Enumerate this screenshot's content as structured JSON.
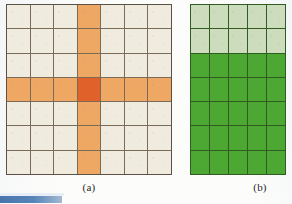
{
  "figure": {
    "panels": [
      {
        "id": "a",
        "caption": "(a)",
        "rows": 7,
        "cols": 7,
        "base_color": "#F0EBDF",
        "highlight_color": "#EFA864",
        "center_color": "#E0622A",
        "gridline_color": "#6B5D4C",
        "highlight_row": 4,
        "highlight_col": 4,
        "cells": [
          [
            "base",
            "base",
            "base",
            "arm",
            "base",
            "base",
            "base"
          ],
          [
            "base",
            "base",
            "base",
            "arm",
            "base",
            "base",
            "base"
          ],
          [
            "base",
            "base",
            "base",
            "arm",
            "base",
            "base",
            "base"
          ],
          [
            "arm",
            "arm",
            "arm",
            "center",
            "arm",
            "arm",
            "arm"
          ],
          [
            "base",
            "base",
            "base",
            "arm",
            "base",
            "base",
            "base"
          ],
          [
            "base",
            "base",
            "base",
            "arm",
            "base",
            "base",
            "base"
          ],
          [
            "base",
            "base",
            "base",
            "arm",
            "base",
            "base",
            "base"
          ]
        ]
      },
      {
        "id": "b",
        "caption": "(b)",
        "rows": 7,
        "cols": 5,
        "light_color": "#CDDCBC",
        "dark_color": "#4CA832",
        "gridline_color": "#2F5D21",
        "light_rows": 2,
        "cells": [
          [
            "light",
            "light",
            "light",
            "light",
            "light"
          ],
          [
            "light",
            "light",
            "light",
            "light",
            "light"
          ],
          [
            "dark",
            "dark",
            "dark",
            "dark",
            "dark"
          ],
          [
            "dark",
            "dark",
            "dark",
            "dark",
            "dark"
          ],
          [
            "dark",
            "dark",
            "dark",
            "dark",
            "dark"
          ],
          [
            "dark",
            "dark",
            "dark",
            "dark",
            "dark"
          ],
          [
            "dark",
            "dark",
            "dark",
            "dark",
            "dark"
          ]
        ]
      }
    ]
  },
  "palette": {
    "cream": "#F0EBDF",
    "orange_light": "#EFA864",
    "orange_deep": "#E0622A",
    "green_light": "#CDDCBC",
    "green_dark": "#4CA832",
    "grid_brown": "#6B5D4C",
    "grid_green": "#2F5D21",
    "page": "#FCFCFA",
    "artifact_blue": "#3F6FA8"
  }
}
